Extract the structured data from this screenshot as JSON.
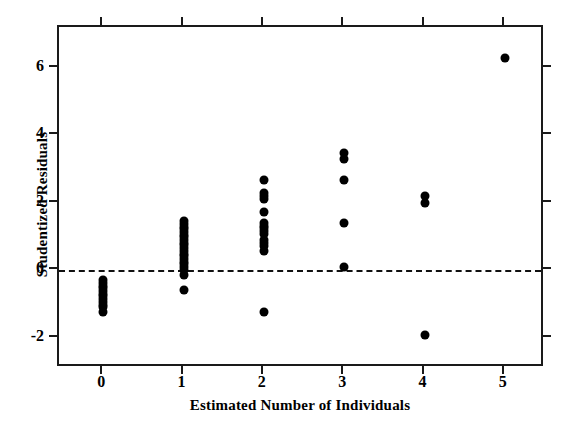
{
  "chart_data": {
    "type": "scatter",
    "title": "",
    "xlabel": "Estimated Number of Individuals",
    "ylabel": "Studentized Residuals",
    "xlim": [
      -0.55,
      5.5
    ],
    "ylim": [
      -2.9,
      7.2
    ],
    "xticks": [
      0,
      1,
      2,
      3,
      4,
      5
    ],
    "xticklabels": [
      "0",
      "1",
      "2",
      "3",
      "4",
      "5"
    ],
    "yticks": [
      -2,
      0,
      2,
      4,
      6
    ],
    "yticklabels": [
      "-2",
      "0",
      "2",
      "4",
      "6"
    ],
    "grid": false,
    "legend": null,
    "frame": "full-box",
    "tick_direction": "outward",
    "marker": "filled-circle",
    "marker_color": "#000000",
    "annotations": [
      {
        "name": "zero-reference-line",
        "type": "horizontal-line",
        "y": 0,
        "style": "dashed",
        "color": "#111111"
      }
    ],
    "series": [
      {
        "name": "Studentized residuals by estimated number of individuals",
        "points": [
          {
            "x": 0,
            "y": -0.3
          },
          {
            "x": 0,
            "y": -0.38
          },
          {
            "x": 0,
            "y": -0.46
          },
          {
            "x": 0,
            "y": -0.54
          },
          {
            "x": 0,
            "y": -0.62
          },
          {
            "x": 0,
            "y": -0.7
          },
          {
            "x": 0,
            "y": -0.78
          },
          {
            "x": 0,
            "y": -0.86
          },
          {
            "x": 0,
            "y": -0.94
          },
          {
            "x": 0,
            "y": -1.02
          },
          {
            "x": 0,
            "y": -1.1
          },
          {
            "x": 0,
            "y": -1.24
          },
          {
            "x": 1,
            "y": 1.45
          },
          {
            "x": 1,
            "y": 1.37
          },
          {
            "x": 1,
            "y": 1.29
          },
          {
            "x": 1,
            "y": 1.21
          },
          {
            "x": 1,
            "y": 1.13
          },
          {
            "x": 1,
            "y": 1.05
          },
          {
            "x": 1,
            "y": 0.97
          },
          {
            "x": 1,
            "y": 0.89
          },
          {
            "x": 1,
            "y": 0.81
          },
          {
            "x": 1,
            "y": 0.73
          },
          {
            "x": 1,
            "y": 0.65
          },
          {
            "x": 1,
            "y": 0.57
          },
          {
            "x": 1,
            "y": 0.49
          },
          {
            "x": 1,
            "y": 0.41
          },
          {
            "x": 1,
            "y": 0.33
          },
          {
            "x": 1,
            "y": 0.25
          },
          {
            "x": 1,
            "y": 0.17
          },
          {
            "x": 1,
            "y": 0.09
          },
          {
            "x": 1,
            "y": 0.01
          },
          {
            "x": 1,
            "y": -0.15
          },
          {
            "x": 1,
            "y": -0.6
          },
          {
            "x": 2,
            "y": 2.68
          },
          {
            "x": 2,
            "y": 2.28
          },
          {
            "x": 2,
            "y": 2.18
          },
          {
            "x": 2,
            "y": 2.1
          },
          {
            "x": 2,
            "y": 1.72
          },
          {
            "x": 2,
            "y": 1.4
          },
          {
            "x": 2,
            "y": 1.32
          },
          {
            "x": 2,
            "y": 1.24
          },
          {
            "x": 2,
            "y": 1.16
          },
          {
            "x": 2,
            "y": 1.08
          },
          {
            "x": 2,
            "y": 0.88
          },
          {
            "x": 2,
            "y": 0.8
          },
          {
            "x": 2,
            "y": 0.72
          },
          {
            "x": 2,
            "y": 0.58
          },
          {
            "x": 2,
            "y": -1.25
          },
          {
            "x": 3,
            "y": 3.46
          },
          {
            "x": 3,
            "y": 3.28
          },
          {
            "x": 3,
            "y": 2.66
          },
          {
            "x": 3,
            "y": 1.4
          },
          {
            "x": 3,
            "y": 0.1
          },
          {
            "x": 4,
            "y": 2.2
          },
          {
            "x": 4,
            "y": 1.98
          },
          {
            "x": 4,
            "y": -1.92
          },
          {
            "x": 5,
            "y": 6.28
          }
        ]
      }
    ]
  },
  "axes": {
    "x_title": "Estimated Number of Individuals",
    "y_title": "Studentized Residuals"
  }
}
